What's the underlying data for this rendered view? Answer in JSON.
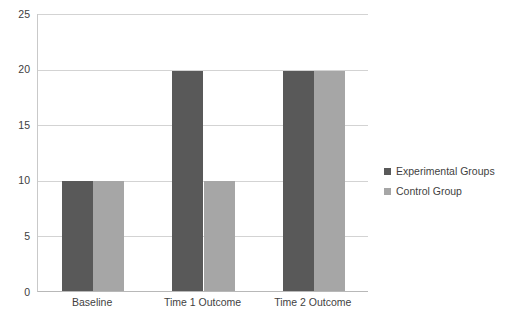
{
  "chart_data": {
    "type": "bar",
    "title": "",
    "subtitle": "",
    "xlabel": "",
    "ylabel": "",
    "categories": [
      "Baseline",
      "Time 1 Outcome",
      "Time 2 Outcome"
    ],
    "series": [
      {
        "name": "Experimental Groups",
        "color": "#595959",
        "values": [
          9.9,
          19.8,
          19.8
        ]
      },
      {
        "name": "Control Group",
        "color": "#a6a6a6",
        "values": [
          9.9,
          9.9,
          19.8
        ]
      }
    ],
    "ylim": [
      0,
      25
    ],
    "yticks": [
      0,
      5,
      10,
      15,
      20,
      25
    ],
    "ytick_labels": [
      "0",
      "5",
      "10",
      "15",
      "20",
      "25"
    ],
    "grid": true,
    "grid_axis": "y",
    "legend_position": "right",
    "bar_gap": 0
  },
  "legend": {
    "items": [
      {
        "label": "Experimental Groups",
        "color": "#595959"
      },
      {
        "label": "Control Group",
        "color": "#a6a6a6"
      }
    ]
  },
  "colors": {
    "series_dark": "#595959",
    "series_light": "#a6a6a6",
    "gridline": "#d3d3d3",
    "axis": "#b8b8b8",
    "text": "#3f3f3f",
    "background": "#ffffff"
  }
}
